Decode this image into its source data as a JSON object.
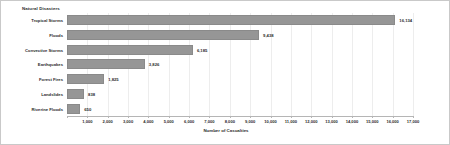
{
  "chart_data": {
    "type": "bar",
    "orientation": "horizontal",
    "title": "Natural Disasters",
    "xlabel": "Number of Casualties",
    "ylabel": "",
    "categories": [
      "Tropical Storms",
      "Floods",
      "Convective Storms",
      "Earthquakes",
      "Forest Fires",
      "Landslides",
      "Riverine Floods"
    ],
    "values": [
      16134,
      9438,
      6185,
      3826,
      1825,
      838,
      650
    ],
    "value_labels": [
      "16,134",
      "9,438",
      "6,185",
      "3,826",
      "1,825",
      "838",
      "650"
    ],
    "xlim": [
      0,
      17000
    ],
    "xticks": [
      0,
      1000,
      2000,
      3000,
      4000,
      5000,
      6000,
      7000,
      8000,
      9000,
      10000,
      11000,
      12000,
      13000,
      14000,
      15000,
      16000,
      17000
    ],
    "xtick_labels": [
      "",
      "1,000",
      "2,000",
      "3,000",
      "4,000",
      "5,000",
      "6,000",
      "7,000",
      "8,000",
      "9,000",
      "10,000",
      "11,000",
      "12,000",
      "13,000",
      "14,000",
      "15,000",
      "16,000",
      "17,000"
    ],
    "grid": true,
    "legend": false,
    "bar_color": "#969696",
    "text_color": "#2b2b2b",
    "grid_color": "#ededed",
    "frame_color": "#c9c9c9"
  }
}
